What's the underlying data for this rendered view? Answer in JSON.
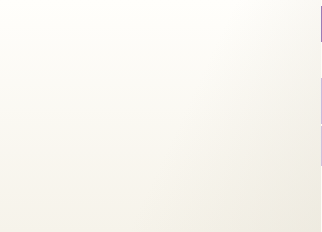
{
  "title": {
    "line1": "Energy-related carbon dioxide emissions: Asia",
    "line2": "and the Pacific (million tonnes carbon)",
    "band_color": "#9b7cb8",
    "text_color": "#25213f"
  },
  "annotation": {
    "year_label": "2002",
    "leader_line_value": 2400
  },
  "colors": {
    "plot_background": "#cfc0de",
    "gridline": "#ded2e8",
    "axis": "#3b3550",
    "bar_blue": "#312b78",
    "bar_black": "#17120f",
    "bar_grey": "#6d6a72",
    "bar_dark": "#241d18",
    "bar_olive": "#6a5d4e"
  },
  "chart_data": {
    "type": "bar",
    "title": "Energy-related carbon dioxide emissions: Asia and the Pacific (million tonnes carbon)",
    "xlabel": "",
    "ylabel": "",
    "ylim": [
      0,
      8000
    ],
    "yticks": [
      0,
      2000,
      4000,
      6000,
      8000
    ],
    "ytick_labels": [
      "0",
      "2 000",
      "4 000",
      "6 000",
      "8 000"
    ],
    "grid": true,
    "legend": "none",
    "categories": [
      "bar-1",
      "bar-2",
      "bar-3",
      "bar-4",
      "bar-5"
    ],
    "values": [
      2400,
      5950,
      4450,
      7450,
      5400
    ],
    "bars": [
      {
        "name": "bar-1",
        "value": 2400,
        "color": "#312b78",
        "icon": "none",
        "icon_label": ""
      },
      {
        "name": "bar-2",
        "value": 5950,
        "color": "#17120f",
        "icon": "coal-icon",
        "icon_label": "coal"
      },
      {
        "name": "bar-3",
        "value": 4450,
        "color": "#6d6a72",
        "icon": "document-icon",
        "icon_label": "oil"
      },
      {
        "name": "bar-4",
        "value": 7450,
        "color": "#241d18",
        "icon": "lock-icon",
        "icon_label": "security"
      },
      {
        "name": "bar-5",
        "value": 5400,
        "color": "#6a5d4e",
        "icon": "sun-icon",
        "icon_label": "renewables"
      }
    ],
    "annotations": [
      {
        "text": "2002",
        "value": 2400,
        "style": "diagonal-leader-line"
      }
    ]
  }
}
